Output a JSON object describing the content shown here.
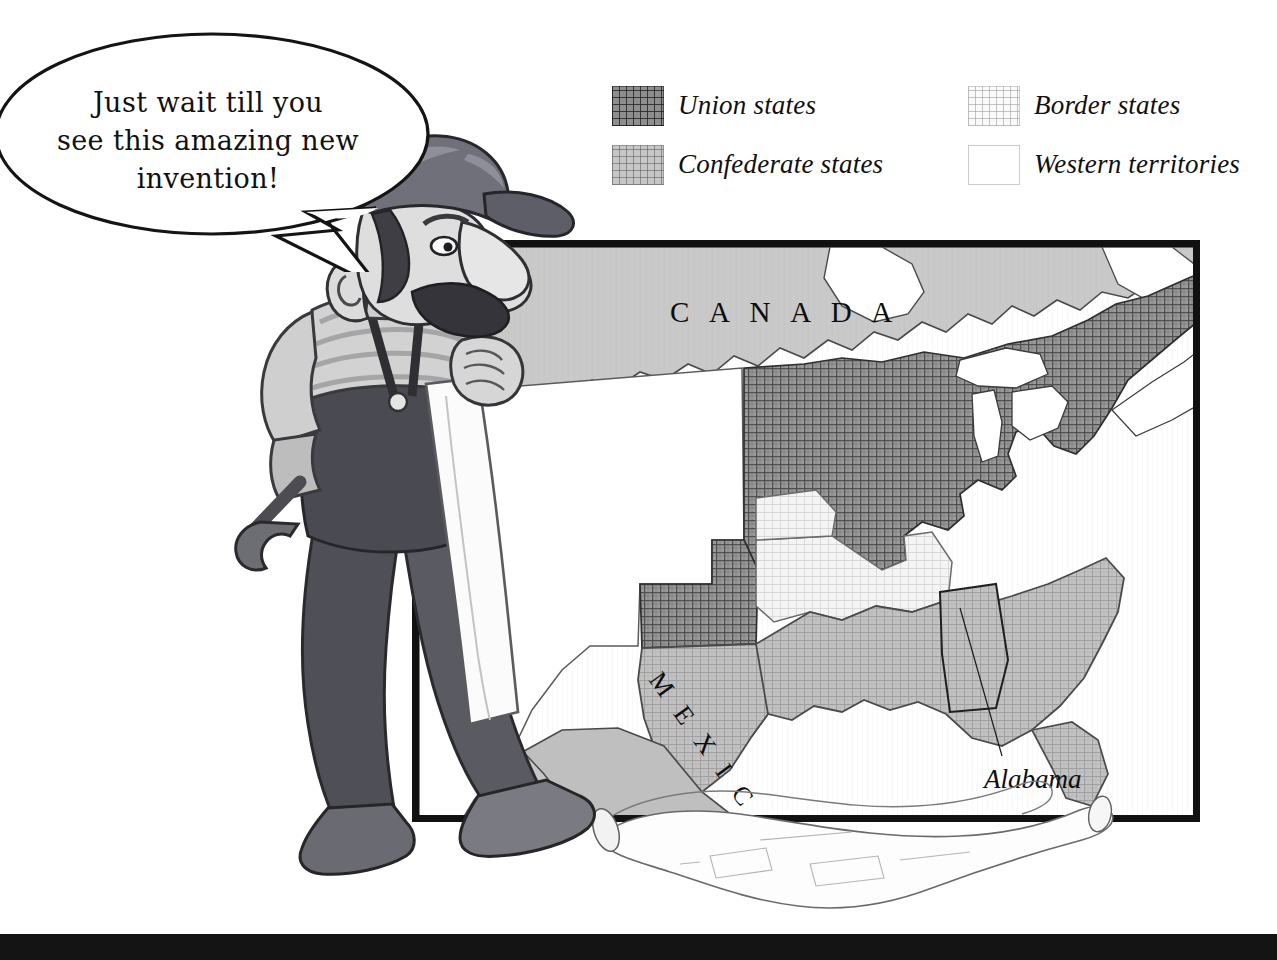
{
  "legend": {
    "items": [
      {
        "label": "Union states",
        "swatch": "union-pattern-swatch",
        "column": "left",
        "fill": "#8e8e8e"
      },
      {
        "label": "Confederate states",
        "swatch": "confederate-pattern-swatch",
        "column": "left",
        "fill": "#c6c6c6"
      },
      {
        "label": "Border states",
        "swatch": "border-pattern-swatch",
        "column": "right",
        "fill": "#fafafa"
      },
      {
        "label": "Western territories",
        "swatch": "western-blank-swatch",
        "column": "right",
        "fill": "#ffffff"
      }
    ]
  },
  "speech_bubble": {
    "line1": "Just wait till you",
    "line2": "see this amazing new",
    "line3": "invention!"
  },
  "map": {
    "labels": {
      "canada": "C A N A D A",
      "mexico": "M E X I C O",
      "callout": "Alabama"
    },
    "colors": {
      "canada_fill": "#c9c9c9",
      "union_fill": "#9a9a9a",
      "confederate_fill": "#c2c2c2",
      "border_fill": "#f2f2f2",
      "territory_fill": "#ffffff",
      "ocean_fill": "#ffffff",
      "frame": "#111111",
      "outline": "#2b2b2b"
    }
  },
  "figure": {
    "alt": "cartoon inventor holding a wrench and rolled blueprints",
    "colors": {
      "cap": "#6e6e6e",
      "skin": "#d9d9d9",
      "hair": "#3a3a3a",
      "shirt": "#cfcfcf",
      "overalls": "#4a4a4a",
      "boots": "#5a5a5a",
      "paper": "#fbfbfb"
    }
  },
  "bottom_bar": {
    "color": "#141414"
  }
}
